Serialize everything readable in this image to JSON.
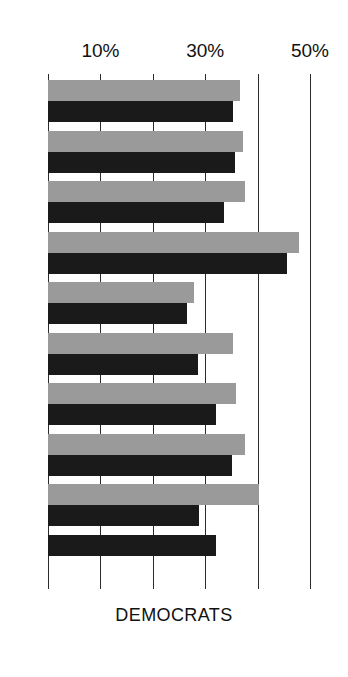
{
  "caption": "DEMOCRATS",
  "chart_data": {
    "type": "bar",
    "orientation": "horizontal",
    "title": "",
    "subtitle": "",
    "xlabel": "",
    "ylabel": "",
    "xlim": [
      0,
      50
    ],
    "grid": true,
    "gridlines": [
      0,
      10,
      20,
      30,
      40,
      50
    ],
    "tick_labels": [
      {
        "value": 10,
        "label": "10%"
      },
      {
        "value": 30,
        "label": "30%"
      },
      {
        "value": 50,
        "label": "50%"
      }
    ],
    "legend": [],
    "legend_position": "none",
    "colors": {
      "series_gray": "#9a9a9a",
      "series_black": "#1a1a1a",
      "gridline": "#2b2b2b",
      "background": "#ffffff",
      "text": "#111111"
    },
    "categories": [
      "row-1",
      "row-2",
      "row-3",
      "row-4",
      "row-5",
      "row-6",
      "row-7",
      "row-8",
      "row-9",
      "row-10"
    ],
    "series": [
      {
        "name": "gray",
        "color": "#9a9a9a",
        "values": [
          36.7,
          37.3,
          37.5,
          47.9,
          27.9,
          35.4,
          35.8,
          37.5,
          40.2,
          null
        ]
      },
      {
        "name": "black",
        "color": "#1a1a1a",
        "values": [
          35.4,
          35.6,
          33.5,
          45.6,
          26.5,
          28.7,
          32.1,
          35.2,
          28.8,
          32.1
        ]
      }
    ]
  }
}
